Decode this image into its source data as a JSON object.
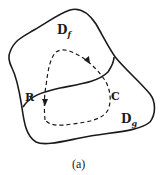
{
  "figure": {
    "caption": "(a)",
    "regions": {
      "top": {
        "main": "D",
        "sub": "f"
      },
      "bottom": {
        "main": "D",
        "sub": "g"
      }
    },
    "labels": {
      "boundary_point": "R",
      "curve": "C"
    },
    "colors": {
      "stroke": "#1a1a1a",
      "background": "#ffffff"
    }
  }
}
